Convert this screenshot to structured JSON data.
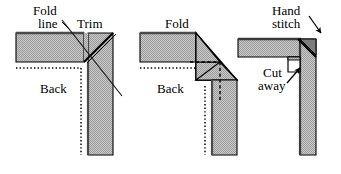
{
  "figure": {
    "background_color": "#ffffff",
    "fabric_fill_color": "#b3b3b3",
    "outline_color": "#000000",
    "panel_count": 3
  },
  "panels": [
    {
      "id": "panel-1-trim",
      "step": 1,
      "labels": {
        "fold_line_1": "Fold",
        "fold_line_2": "line",
        "trim": "Trim",
        "back": "Back"
      },
      "markings": {
        "fold_line_style": "dotted",
        "trim_line_style": "diagonal-solid",
        "stitch_line_style": "dotted"
      }
    },
    {
      "id": "panel-2-fold",
      "step": 2,
      "labels": {
        "fold": "Fold",
        "back": "Back"
      },
      "markings": {
        "fold_line_style": "dashed",
        "seam_line_style": "dotted"
      }
    },
    {
      "id": "panel-3-hand-stitch",
      "step": 3,
      "labels": {
        "hand_stitch_1": "Hand",
        "hand_stitch_2": "stitch",
        "cut_away_1": "Cut",
        "cut_away_2": "away"
      },
      "markings": {
        "miter_seam_style": "solid-diagonal",
        "notch": "cut-away-square"
      }
    }
  ],
  "text_items": [
    {
      "name": "fold-line-label-row1",
      "text": "Fold",
      "x": 33,
      "y": 5,
      "panel": 1
    },
    {
      "name": "fold-line-label-row2",
      "text": "line",
      "x": 36,
      "y": 18,
      "panel": 1
    },
    {
      "name": "trim-label",
      "text": "Trim",
      "x": 76,
      "y": 18,
      "panel": 1
    },
    {
      "name": "back-label-1",
      "text": "Back",
      "x": 40,
      "y": 83,
      "panel": 1
    },
    {
      "name": "fold-label-2",
      "text": "Fold",
      "x": 166,
      "y": 18,
      "panel": 2
    },
    {
      "name": "back-label-2",
      "text": "Back",
      "x": 158,
      "y": 83,
      "panel": 2
    },
    {
      "name": "hand-label",
      "text": "Hand",
      "x": 271,
      "y": 5,
      "panel": 3
    },
    {
      "name": "stitch-label",
      "text": "stitch",
      "x": 271,
      "y": 18,
      "panel": 3
    },
    {
      "name": "cut-label",
      "text": "Cut",
      "x": 262,
      "y": 67,
      "panel": 3
    },
    {
      "name": "away-label",
      "text": "away",
      "x": 258,
      "y": 80,
      "panel": 3
    }
  ]
}
